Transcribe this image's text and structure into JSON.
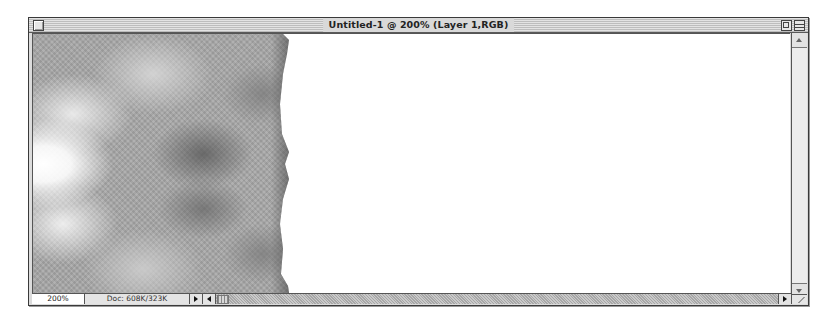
{
  "window": {
    "title": "Untitled-1 @ 200% (Layer 1,RGB)",
    "controls": {
      "close_icon": "close-box",
      "zoom_icon": "zoom-box",
      "collapse_icon": "collapse-box"
    }
  },
  "canvas": {
    "content": "clouds-texture-left-half",
    "background": "#ffffff",
    "texture_color": "#a9a9a9"
  },
  "statusbar": {
    "zoom_level": "200%",
    "doc_info": "Doc: 608K/323K"
  },
  "scrollbars": {
    "vertical": {
      "up_icon": "arrow-up",
      "down_icon": "arrow-down"
    },
    "horizontal": {
      "right_icon": "arrow-right"
    }
  }
}
